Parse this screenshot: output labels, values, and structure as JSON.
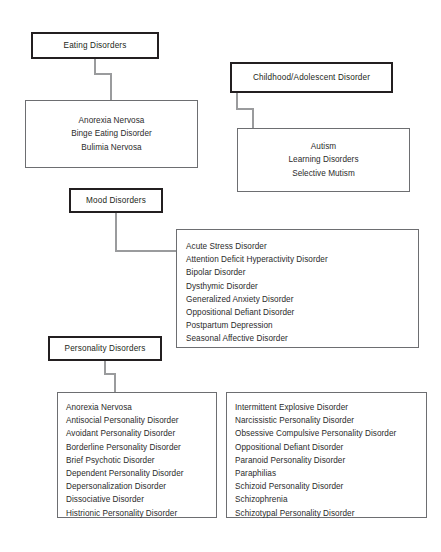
{
  "diagram": {
    "colors": {
      "page_background": "#ffffff",
      "category_border": "#231f20",
      "list_border": "#6d6e71",
      "connector": "#9a9b9d",
      "text": "#231f20"
    },
    "groups": [
      {
        "id": "eating-disorders",
        "header": "Eating Disorders",
        "items": [
          "Anorexia Nervosa",
          "Binge Eating Disorder",
          "Bulimia Nervosa"
        ]
      },
      {
        "id": "childhood-adolescent-disorder",
        "header": "Childhood/Adolescent Disorder",
        "items": [
          "Autism",
          "Learning Disorders",
          "Selective Mutism"
        ]
      },
      {
        "id": "mood-disorders",
        "header": "Mood Disorders",
        "items": [
          "Acute Stress Disorder",
          "Attention Deficit Hyperactivity Disorder",
          "Bipolar Disorder",
          "Dysthymic Disorder",
          "Generalized Anxiety Disorder",
          "Oppositional Defiant Disorder",
          "Postpartum Depression",
          "Seasonal Affective Disorder"
        ]
      },
      {
        "id": "personality-disorders",
        "header": "Personality Disorders",
        "items_left": [
          "Anorexia Nervosa",
          "Antisocial Personality Disorder",
          "Avoidant Personality Disorder",
          "Borderline Personality Disorder",
          "Brief Psychotic Disorder",
          "Dependent Personality Disorder",
          "Depersonalization Disorder",
          "Dissociative Disorder",
          "Histrionic Personality Disorder"
        ],
        "items_right": [
          "Intermittent Explosive Disorder",
          "Narcissistic Personality Disorder",
          "Obsessive Compulsive Personality Disorder",
          "Oppositional Defiant Disorder",
          "Paranoid Personality Disorder",
          "Paraphilias",
          "Schizoid Personality Disorder",
          "Schizophrenia",
          "Schizotypal Personality Disorder"
        ]
      }
    ]
  }
}
